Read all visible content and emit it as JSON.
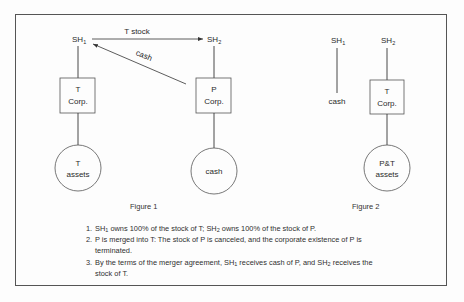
{
  "figure1": {
    "caption": "Figure 1",
    "sh1": {
      "base": "SH",
      "sub": "1"
    },
    "sh2": {
      "base": "SH",
      "sub": "2"
    },
    "t_stock_arrow_label": "T stock",
    "cash_arrow_label": "cash",
    "t_corp": {
      "line1": "T",
      "line2": "Corp."
    },
    "p_corp": {
      "line1": "P",
      "line2": "Corp."
    },
    "t_assets": {
      "line1": "T",
      "line2": "assets"
    },
    "p_assets": {
      "line1": "cash"
    }
  },
  "figure2": {
    "caption": "Figure 2",
    "sh1": {
      "base": "SH",
      "sub": "1"
    },
    "sh2": {
      "base": "SH",
      "sub": "2"
    },
    "sh1_holding": "cash",
    "t_corp": {
      "line1": "T",
      "line2": "Corp."
    },
    "assets": {
      "line1": "P&T",
      "line2": "assets"
    }
  },
  "notes": [
    {
      "num": "1.",
      "parts": [
        "SH",
        "1",
        " owns 100% of the stock of T; SH",
        "2",
        "  owns 100% of the stock of P."
      ]
    },
    {
      "num": "2.",
      "text": "P is merged into T: The stock of P is canceled, and the corporate existence of P is terminated."
    },
    {
      "num": "3.",
      "parts": [
        "By the terms of the merger agreement, SH",
        "1",
        " receives cash of P, and SH",
        "2",
        " receives the stock of T."
      ]
    }
  ]
}
